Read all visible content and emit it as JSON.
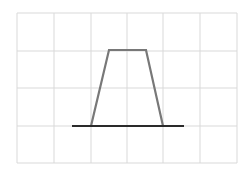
{
  "diagram": {
    "type": "trapezoid-on-grid",
    "colors": {
      "background": "#ffffff",
      "grid": "#d9d9d9",
      "trapezoid": "#787878",
      "baseline": "#2a2a2a"
    },
    "grid": {
      "x_lines": [
        17,
        54,
        91,
        127,
        163,
        200,
        237
      ],
      "y_lines": [
        13,
        51,
        88,
        126,
        163
      ],
      "columns": 6,
      "rows": 4
    },
    "trapezoid": {
      "points": [
        [
          91,
          126
        ],
        [
          109,
          50
        ],
        [
          146,
          50
        ],
        [
          163,
          126
        ]
      ]
    },
    "baseline": {
      "x1": 72,
      "y1": 126,
      "x2": 184,
      "y2": 126
    }
  }
}
